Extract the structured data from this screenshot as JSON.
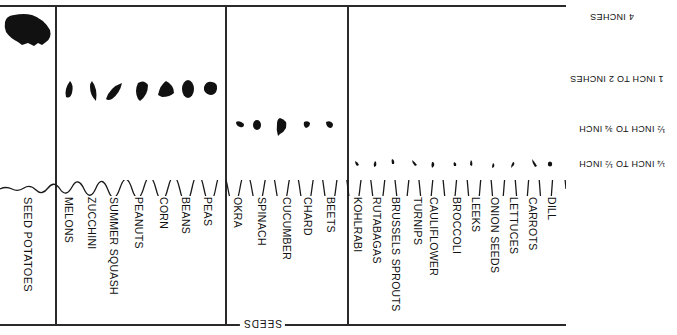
{
  "diagram": {
    "title_label": "SEEDS",
    "depth_labels": [
      {
        "text": "4 INCHES",
        "x": 590,
        "y": 12
      },
      {
        "text": "1 INCH TO 2 INCHES",
        "x": 570,
        "y": 74
      },
      {
        "text": "½ INCH TO ¾ INCH",
        "x": 579,
        "y": 124
      },
      {
        "text": "¼ INCH TO ½ INCH",
        "x": 579,
        "y": 159
      }
    ],
    "groups": [
      {
        "depth": "4 INCHES",
        "plants": [
          "SEED POTATOES"
        ]
      },
      {
        "depth": "1 INCH TO 2 INCHES",
        "plants": [
          "MELONS",
          "ZUCCHINI",
          "SUMMER SQUASH",
          "PEANUTS",
          "CORN",
          "BEANS",
          "PEAS"
        ]
      },
      {
        "depth": "½ INCH TO ¾ INCH",
        "plants": [
          "OKRA",
          "SPINACH",
          "CUCUMBER",
          "CHARD",
          "BEETS"
        ]
      },
      {
        "depth": "¼ INCH TO ½ INCH",
        "plants": [
          "KOHLRABI",
          "RUTABAGAS",
          "BRUSSELS SPROUTS",
          "TURNIPS",
          "CAULIFLOWER",
          "BROCCOLI",
          "LEEKS",
          "ONION SEEDS",
          "LETTUCES",
          "CARROTS",
          "DILL"
        ]
      }
    ],
    "labels": {
      "seed_potatoes": "SEED POTATOES",
      "melons": "MELONS",
      "zucchini": "ZUCCHINI",
      "summer_squash": "SUMMER SQUASH",
      "peanuts": "PEANUTS",
      "corn": "CORN",
      "beans": "BEANS",
      "peas": "PEAS",
      "okra": "OKRA",
      "spinach": "SPINACH",
      "cucumber": "CUCUMBER",
      "chard": "CHARD",
      "beets": "BEETS",
      "kohlrabi": "KOHLRABI",
      "rutabagas": "RUTABAGAS",
      "brussels_sprouts": "BRUSSELS SPROUTS",
      "turnips": "TURNIPS",
      "cauliflower": "CAULIFLOWER",
      "broccoli": "BROCCOLI",
      "leeks": "LEEKS",
      "onion_seeds": "ONION SEEDS",
      "lettuces": "LETTUCES",
      "carrots": "CARROTS",
      "dill": "DILL"
    },
    "depths": {
      "d4": "4 INCHES",
      "d1_2": "1 INCH TO 2 INCHES",
      "d12_34": "½ INCH TO ¾ INCH",
      "d14_12": "¼ INCH TO ½ INCH"
    },
    "colors": {
      "ink": "#111111",
      "background": "#ffffff"
    }
  }
}
